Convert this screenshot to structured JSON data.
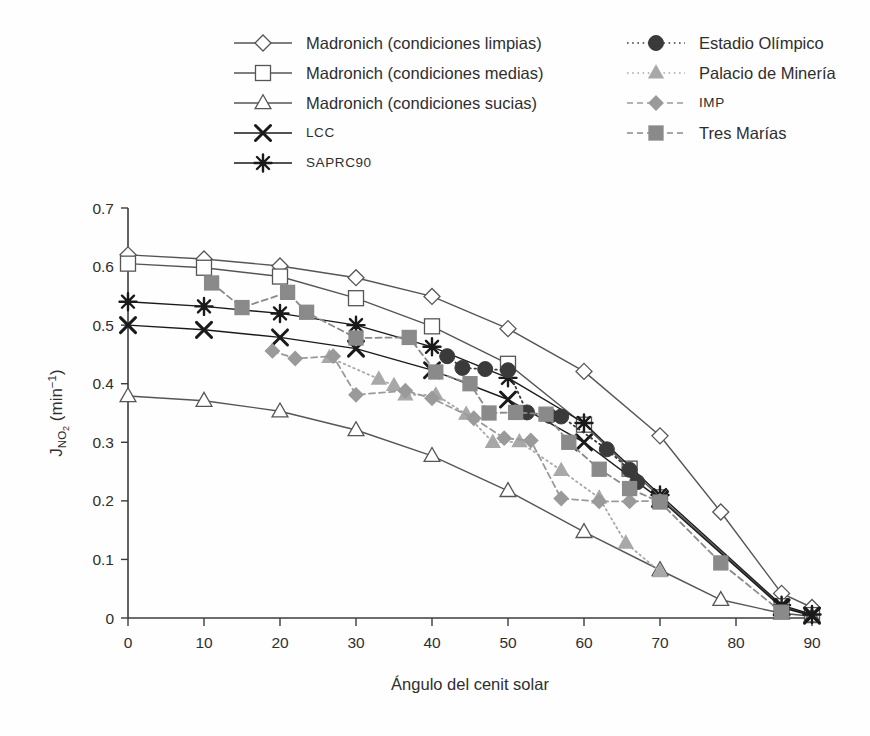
{
  "chart_data": {
    "type": "line",
    "title": "",
    "xlabel": "Ángulo del cenit solar",
    "ylabel": "J_NO2 (min^-1)",
    "ylabel_parts": {
      "base": "J",
      "sub": "NO",
      "sub2": "2",
      "units": "(min",
      "exp": "−1",
      "units_close": ")"
    },
    "xlim": [
      0,
      90
    ],
    "ylim": [
      0,
      0.7
    ],
    "xticks": [
      0,
      10,
      20,
      30,
      40,
      50,
      60,
      70,
      80,
      90
    ],
    "yticks": [
      0,
      0.1,
      0.2,
      0.3,
      0.4,
      0.5,
      0.6,
      0.7
    ],
    "xtick_labels": [
      "0",
      "10",
      "20",
      "30",
      "40",
      "50",
      "60",
      "70",
      "80",
      "90"
    ],
    "ytick_labels": [
      "0",
      "0.1",
      "0.2",
      "0.3",
      "0.4",
      "0.5",
      "0.6",
      "0.7"
    ],
    "grid": false,
    "legend_position": "top",
    "series": [
      {
        "name": "Madronich (condiciones limpias)",
        "marker": "diamond-open",
        "line": "solid",
        "color": "#555555",
        "fill": "#ffffff",
        "x": [
          0,
          10,
          20,
          30,
          40,
          50,
          60,
          70,
          78,
          86,
          90
        ],
        "y": [
          0.62,
          0.613,
          0.601,
          0.581,
          0.549,
          0.494,
          0.421,
          0.311,
          0.181,
          0.042,
          0.018
        ]
      },
      {
        "name": "Madronich (condiciones medias)",
        "marker": "square-open",
        "line": "solid",
        "color": "#555555",
        "fill": "#ffffff",
        "x": [
          0,
          10,
          20,
          30,
          40,
          50,
          60,
          66,
          70,
          86,
          90
        ],
        "y": [
          0.605,
          0.598,
          0.583,
          0.546,
          0.498,
          0.434,
          0.33,
          0.255,
          0.206,
          0.02,
          0.005
        ]
      },
      {
        "name": "Madronich (condiciones sucias)",
        "marker": "triangle-open",
        "line": "solid",
        "color": "#555555",
        "fill": "#ffffff",
        "x": [
          0,
          10,
          20,
          30,
          40,
          50,
          60,
          70,
          78,
          86,
          90
        ],
        "y": [
          0.379,
          0.371,
          0.353,
          0.321,
          0.277,
          0.217,
          0.147,
          0.082,
          0.031,
          0.008,
          0.003
        ]
      },
      {
        "name": "LCC",
        "marker": "cross",
        "line": "solid",
        "color": "#1a1a1a",
        "fill": "#1a1a1a",
        "x": [
          0,
          10,
          20,
          30,
          40,
          50,
          60,
          70,
          86,
          90
        ],
        "y": [
          0.5,
          0.492,
          0.479,
          0.46,
          0.423,
          0.373,
          0.3,
          0.203,
          0.018,
          0.004
        ]
      },
      {
        "name": "SAPRC90",
        "marker": "asterisk",
        "line": "solid",
        "color": "#1a1a1a",
        "fill": "#1a1a1a",
        "x": [
          0,
          10,
          20,
          30,
          40,
          50,
          60,
          70,
          86,
          90
        ],
        "y": [
          0.54,
          0.532,
          0.52,
          0.5,
          0.463,
          0.41,
          0.333,
          0.21,
          0.022,
          0.006
        ]
      },
      {
        "name": "Estadio Olímpico",
        "marker": "circle-filled",
        "line": "dotted",
        "color": "#3a3a3a",
        "fill": "#3a3a3a",
        "x": [
          42,
          44,
          47,
          50,
          52.5,
          55.5,
          57,
          63,
          66,
          67
        ],
        "y": [
          0.447,
          0.427,
          0.425,
          0.423,
          0.351,
          0.345,
          0.344,
          0.288,
          0.253,
          0.232
        ]
      },
      {
        "name": "Palacio de Minería",
        "marker": "triangle-filled",
        "line": "dotted",
        "color": "#a8a8a8",
        "fill": "#a8a8a8",
        "x": [
          26.5,
          33,
          35,
          36.5,
          40.5,
          44.5,
          48,
          51.5,
          57,
          62,
          65.5,
          70
        ],
        "y": [
          0.445,
          0.408,
          0.397,
          0.381,
          0.381,
          0.348,
          0.3,
          0.301,
          0.252,
          0.205,
          0.128,
          0.079
        ]
      },
      {
        "name": "IMP",
        "marker": "diamond-filled",
        "line": "dashed",
        "color": "#9a9a9a",
        "fill": "#9a9a9a",
        "x": [
          19,
          22,
          27,
          30,
          36.5,
          40,
          45.5,
          49.5,
          53,
          57,
          62,
          66,
          70
        ],
        "y": [
          0.456,
          0.443,
          0.447,
          0.381,
          0.388,
          0.375,
          0.341,
          0.307,
          0.303,
          0.204,
          0.199,
          0.199,
          0.2
        ]
      },
      {
        "name": "Tres Marías",
        "marker": "square-filled",
        "line": "dashed",
        "color": "#8a8a8a",
        "fill": "#8a8a8a",
        "x": [
          11,
          15,
          21,
          23.5,
          30,
          37,
          40.5,
          45,
          47.5,
          51,
          55,
          58,
          62,
          66,
          70,
          78,
          86
        ],
        "y": [
          0.572,
          0.53,
          0.556,
          0.522,
          0.478,
          0.479,
          0.42,
          0.4,
          0.35,
          0.351,
          0.348,
          0.3,
          0.254,
          0.221,
          0.198,
          0.094,
          0.01
        ]
      }
    ]
  },
  "legend": {
    "left_column": [
      {
        "label": "Madronich (condiciones limpias)",
        "marker": "diamond-open",
        "line": "solid",
        "small_caps": false
      },
      {
        "label": "Madronich (condiciones medias)",
        "marker": "square-open",
        "line": "solid",
        "small_caps": false
      },
      {
        "label": "Madronich (condiciones sucias)",
        "marker": "triangle-open",
        "line": "solid",
        "small_caps": false
      },
      {
        "label": "LCC",
        "marker": "cross",
        "line": "solid",
        "small_caps": true
      },
      {
        "label": "SAPRC90",
        "marker": "asterisk",
        "line": "solid",
        "small_caps": true
      }
    ],
    "right_column": [
      {
        "label": "Estadio Olímpico",
        "marker": "circle-filled",
        "line": "dotted",
        "small_caps": false
      },
      {
        "label": "Palacio de Minería",
        "marker": "triangle-filled",
        "line": "dotted",
        "small_caps": false
      },
      {
        "label": "IMP",
        "marker": "diamond-filled",
        "line": "dashed",
        "small_caps": true
      },
      {
        "label": "Tres Marías",
        "marker": "square-filled",
        "line": "dashed",
        "small_caps": false
      }
    ]
  },
  "colors": {
    "axis": "#3c3c3c",
    "text": "#2e2e2e",
    "background": "#fefefe",
    "open_marker_stroke": "#555555",
    "dark_marker": "#1a1a1a",
    "grey_marker": "#9a9a9a"
  }
}
